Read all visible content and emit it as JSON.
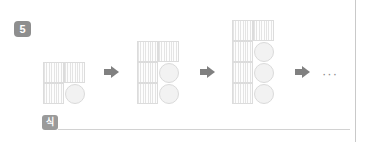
{
  "page": {
    "background_color": "#ffffff",
    "edge_rule_color": "#c9c9c9"
  },
  "problem": {
    "number": "5",
    "number_badge_color": "#8e8e8e"
  },
  "pattern": {
    "arrow_glyph": "→",
    "arrow_color": "#808080",
    "ellipsis": "···",
    "square_fill": "#fcfcfc",
    "square_stroke": "#dcdcdc",
    "circle_fill": "#f2f2f2",
    "circle_stroke": "#dadada",
    "steps": [
      {
        "index": 1,
        "left": 3,
        "squares": 3,
        "circles": 1,
        "rows": [
          [
            "square",
            "square"
          ],
          [
            "square",
            "circle"
          ]
        ]
      },
      {
        "index": 2,
        "left": 97,
        "squares": 4,
        "circles": 2,
        "rows": [
          [
            "square",
            "square"
          ],
          [
            "square",
            "circle"
          ],
          [
            "square",
            "circle"
          ]
        ]
      },
      {
        "index": 3,
        "left": 192,
        "squares": 5,
        "circles": 3,
        "rows": [
          [
            "square",
            "square"
          ],
          [
            "square",
            "circle"
          ],
          [
            "square",
            "circle"
          ],
          [
            "square",
            "circle"
          ]
        ]
      }
    ],
    "arrows": [
      {
        "index": 1,
        "left": 64
      },
      {
        "index": 2,
        "left": 160
      },
      {
        "index": 3,
        "left": 255
      }
    ],
    "ellipsis_left": 282
  },
  "answer": {
    "label": "식",
    "label_badge_color": "#9a9a9a",
    "value": "",
    "placeholder": "",
    "line_color": "#d2d2d2"
  }
}
